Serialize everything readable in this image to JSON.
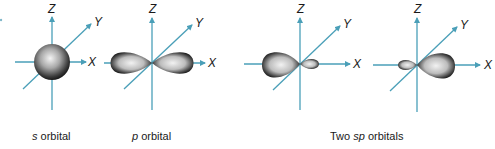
{
  "figure": {
    "axis_color": "#4a9fb8",
    "panels": [
      {
        "id": "s",
        "caption_prefix": "",
        "caption_italic": "s",
        "caption_suffix": " orbital",
        "axis_labels": {
          "x": "X",
          "y": "Y",
          "z": "Z"
        },
        "shape": "sphere"
      },
      {
        "id": "p",
        "caption_prefix": "",
        "caption_italic": "p",
        "caption_suffix": " orbital",
        "axis_labels": {
          "x": "X",
          "y": "Y",
          "z": "Z"
        },
        "shape": "dumbbell"
      },
      {
        "id": "sp1",
        "axis_labels": {
          "x": "X",
          "y": "Y",
          "z": "Z"
        },
        "shape": "large-lobe-left"
      },
      {
        "id": "sp2",
        "axis_labels": {
          "x": "X",
          "y": "Y",
          "z": "Z"
        },
        "shape": "large-lobe-right"
      }
    ],
    "sp_caption": {
      "prefix": "Two ",
      "italic": "sp",
      "suffix": " orbitals"
    }
  }
}
